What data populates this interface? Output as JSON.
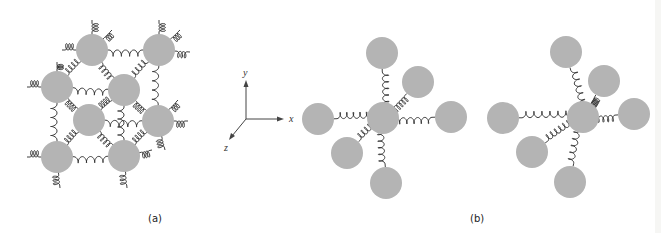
{
  "figure": {
    "panels": [
      {
        "id": "a",
        "label": "(a)",
        "description": "Lattice of atoms connected by springs"
      },
      {
        "id": "b",
        "label": "(b)",
        "description": "Single atom connected to six neighbors by springs (two states)"
      }
    ],
    "axes": {
      "x": "x",
      "y": "y",
      "z": "z"
    },
    "colors": {
      "atom": "#b4b4b4",
      "spring": "#2a2a2a",
      "axis": "#444444",
      "background": "#ffffff"
    }
  },
  "diagram": {
    "atom_radius": 16,
    "panel_a": {
      "atoms": [
        [
          92,
          50
        ],
        [
          159,
          50
        ],
        [
          57,
          87
        ],
        [
          124,
          90
        ],
        [
          89,
          120
        ],
        [
          158,
          121
        ],
        [
          57,
          157
        ],
        [
          124,
          156
        ]
      ],
      "springs": [
        [
          0,
          1
        ],
        [
          0,
          2
        ],
        [
          0,
          3
        ],
        [
          1,
          3
        ],
        [
          1,
          5
        ],
        [
          2,
          3
        ],
        [
          2,
          4
        ],
        [
          2,
          6
        ],
        [
          3,
          4
        ],
        [
          3,
          5
        ],
        [
          3,
          7
        ],
        [
          4,
          5
        ],
        [
          4,
          6
        ],
        [
          4,
          7
        ],
        [
          5,
          7
        ],
        [
          6,
          7
        ]
      ],
      "dangling": [
        [
          92,
          50,
          92,
          20
        ],
        [
          92,
          50,
          112,
          30
        ],
        [
          92,
          50,
          62,
          50
        ],
        [
          159,
          50,
          159,
          20
        ],
        [
          159,
          50,
          180,
          30
        ],
        [
          159,
          50,
          190,
          52
        ],
        [
          57,
          87,
          27,
          87
        ],
        [
          57,
          87,
          57,
          62
        ],
        [
          158,
          121,
          188,
          121
        ],
        [
          158,
          121,
          178,
          100
        ],
        [
          158,
          121,
          165,
          150
        ],
        [
          57,
          157,
          27,
          157
        ],
        [
          57,
          157,
          60,
          188
        ],
        [
          124,
          156,
          127,
          188
        ],
        [
          124,
          156,
          152,
          150
        ]
      ]
    },
    "panel_b1": {
      "center": [
        383,
        118
      ],
      "neighbors": [
        [
          382,
          53
        ],
        [
          418,
          82
        ],
        [
          318,
          119
        ],
        [
          451,
          117
        ],
        [
          347,
          153
        ],
        [
          386,
          183
        ]
      ],
      "turns": [
        5,
        5,
        5,
        5,
        4,
        5
      ]
    },
    "panel_b2": {
      "center": [
        583,
        117
      ],
      "neighbors": [
        [
          566,
          52
        ],
        [
          604,
          81
        ],
        [
          503,
          118
        ],
        [
          634,
          114
        ],
        [
          532,
          152
        ],
        [
          570,
          182
        ]
      ],
      "turns": [
        5,
        7,
        6,
        4,
        6,
        5
      ]
    },
    "axis_origin": [
      246,
      119
    ]
  }
}
